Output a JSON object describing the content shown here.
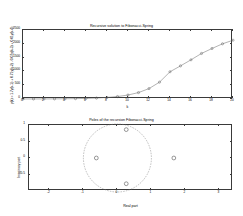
{
  "figure": {
    "background": "#ffffff",
    "axis_color": "#3a3a3a",
    "line_color": "#555555",
    "marker_color": "#555555"
  },
  "chart_data": [
    {
      "type": "line",
      "id": "recursive-solution",
      "title": "Recursive solution to  Fibonacci-Spring",
      "xlabel": "k",
      "ylabel": "y(k) = 1.7y(k-1) + 0.71y(k-2) - 0.07y(k-3) + 0.01y(k-4)",
      "xlim": [
        0,
        20
      ],
      "ylim": [
        0,
        2500
      ],
      "xticks": [
        0,
        2,
        4,
        6,
        8,
        10,
        12,
        14,
        16,
        18,
        20
      ],
      "xticklabels": [
        "0",
        "2",
        "4",
        "6",
        "8",
        "10",
        "12",
        "14",
        "16",
        "18",
        "20"
      ],
      "yticks": [
        0,
        500,
        1000,
        1500,
        2000,
        2500
      ],
      "yticklabels": [
        "0",
        "500",
        "1000",
        "1500",
        "2000",
        "2500"
      ],
      "grid": false,
      "marker": "circle",
      "x": [
        0,
        1,
        2,
        3,
        4,
        5,
        6,
        7,
        8,
        9,
        10,
        11,
        12,
        13,
        14,
        15,
        16,
        17,
        18,
        19,
        20
      ],
      "y": [
        1,
        2,
        3,
        5,
        8,
        13,
        21,
        34,
        55,
        89,
        144,
        233,
        377,
        610,
        987,
        1200,
        1420,
        1650,
        1830,
        2000,
        2130
      ]
    },
    {
      "type": "scatter",
      "id": "poles",
      "title": "Poles of the recursion  Fibonacci-Spring",
      "xlabel": "Real part",
      "ylabel": "Imaginary part",
      "xlim": [
        -2.6,
        3.4
      ],
      "ylim": [
        -1.0,
        1.0
      ],
      "xticks": [
        -2,
        -1,
        0,
        1,
        2,
        3
      ],
      "xticklabels": [
        "-2",
        "-1",
        "0",
        "1",
        "2",
        "3"
      ],
      "yticks": [
        -0.5,
        0,
        0.5,
        1
      ],
      "yticklabels": [
        "-0.5",
        "0",
        "0.5",
        "1"
      ],
      "grid": false,
      "marker": "circle",
      "unit_circle": true,
      "unit_circle_radius": 1,
      "points": [
        {
          "real": -0.62,
          "imag": 0.0
        },
        {
          "real": 1.66,
          "imag": 0.0
        },
        {
          "real": 0.26,
          "imag": 0.86
        },
        {
          "real": 0.26,
          "imag": -0.78
        }
      ]
    }
  ]
}
